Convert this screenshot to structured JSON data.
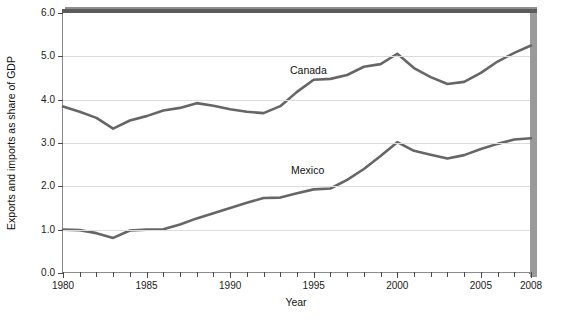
{
  "chart_data": {
    "type": "line",
    "title": "",
    "xlabel": "Year",
    "ylabel": "Exports and imports as share of GDP",
    "xlim": [
      1980,
      2008
    ],
    "ylim": [
      0.0,
      6.0
    ],
    "grid": true,
    "legend_position": "inline-annotation",
    "x": [
      1980,
      1981,
      1982,
      1983,
      1984,
      1985,
      1986,
      1987,
      1988,
      1989,
      1990,
      1991,
      1992,
      1993,
      1994,
      1995,
      1996,
      1997,
      1998,
      1999,
      2000,
      2001,
      2002,
      2003,
      2004,
      2005,
      2006,
      2007,
      2008
    ],
    "series": [
      {
        "name": "Canada",
        "color": "#666666",
        "values": [
          3.84,
          3.72,
          3.58,
          3.33,
          3.52,
          3.62,
          3.75,
          3.81,
          3.92,
          3.86,
          3.78,
          3.72,
          3.69,
          3.85,
          4.18,
          4.46,
          4.48,
          4.57,
          4.76,
          4.82,
          5.06,
          4.73,
          4.52,
          4.36,
          4.41,
          4.62,
          4.88,
          5.08,
          5.25
        ]
      },
      {
        "name": "Mexico",
        "color": "#666666",
        "values": [
          1.0,
          0.99,
          0.92,
          0.81,
          0.98,
          1.0,
          1.01,
          1.12,
          1.26,
          1.38,
          1.5,
          1.62,
          1.73,
          1.74,
          1.84,
          1.93,
          1.95,
          2.15,
          2.4,
          2.7,
          3.02,
          2.82,
          2.73,
          2.64,
          2.72,
          2.86,
          2.98,
          3.08,
          3.11
        ]
      }
    ],
    "y_ticks": [
      {
        "value": 0.0,
        "label": "0.0"
      },
      {
        "value": 1.0,
        "label": "1.0"
      },
      {
        "value": 2.0,
        "label": "2.0"
      },
      {
        "value": 3.0,
        "label": "3.0"
      },
      {
        "value": 4.0,
        "label": "4.0"
      },
      {
        "value": 5.0,
        "label": "5.0"
      },
      {
        "value": 6.0,
        "label": "6.0"
      }
    ],
    "x_ticks": [
      1980,
      1981,
      1982,
      1983,
      1984,
      1985,
      1986,
      1987,
      1988,
      1989,
      1990,
      1991,
      1992,
      1993,
      1994,
      1995,
      1996,
      1997,
      1998,
      1999,
      2000,
      2001,
      2002,
      2003,
      2004,
      2005,
      2006,
      2007,
      2008
    ],
    "x_tick_labels": [
      {
        "value": 1980,
        "label": "1980"
      },
      {
        "value": 1985,
        "label": "1985"
      },
      {
        "value": 1990,
        "label": "1990"
      },
      {
        "value": 1995,
        "label": "1995"
      },
      {
        "value": 2000,
        "label": "2000"
      },
      {
        "value": 2005,
        "label": "2005"
      },
      {
        "value": 2008,
        "label": "2008"
      }
    ],
    "annotations": [
      {
        "text": "Canada",
        "series": "Canada"
      },
      {
        "text": "Mexico",
        "series": "Mexico"
      }
    ]
  },
  "colors": {
    "line": "#666666",
    "grid": "#dcdcdc",
    "axis": "#8a8a8a",
    "frame_top": "#5c5c5c",
    "frame_side": "#9a9a9a",
    "background": "#ffffff"
  }
}
